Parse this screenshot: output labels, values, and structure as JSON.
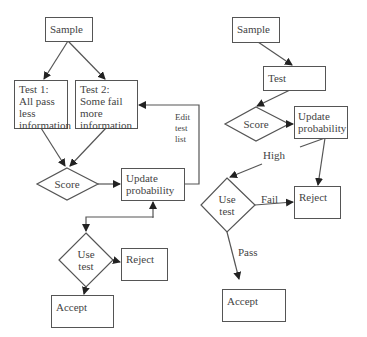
{
  "left_flow": {
    "sample": "Sample",
    "test1": [
      "Test 1:",
      "All pass",
      "less",
      "information"
    ],
    "test2": [
      "Test 2:",
      "Some fail",
      "more",
      "information"
    ],
    "score": "Score",
    "update": [
      "Update",
      "probability"
    ],
    "edit_label": [
      "Edit",
      "test",
      "list"
    ],
    "use_test": [
      "Use",
      "test"
    ],
    "reject": "Reject",
    "accept": "Accept"
  },
  "right_flow": {
    "sample": "Sample",
    "test": "Test",
    "score": "Score",
    "update": [
      "Update",
      "probability"
    ],
    "high_label": "High",
    "use_test": [
      "Use",
      "test"
    ],
    "fail_label": "Fail",
    "pass_label": "Pass",
    "reject": "Reject",
    "accept": "Accept"
  },
  "colors": {
    "stroke": "#555555",
    "text": "#444444",
    "background": "#ffffff"
  }
}
